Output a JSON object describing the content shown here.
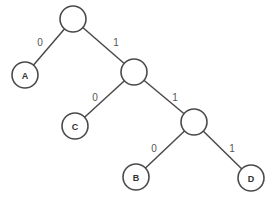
{
  "diagram": {
    "type": "binary-tree",
    "nodes": [
      {
        "id": "n0",
        "label": "",
        "x": 73,
        "y": 19
      },
      {
        "id": "A",
        "label": "A",
        "x": 25,
        "y": 75
      },
      {
        "id": "n1",
        "label": "",
        "x": 134,
        "y": 72
      },
      {
        "id": "C",
        "label": "C",
        "x": 75,
        "y": 126
      },
      {
        "id": "n2",
        "label": "",
        "x": 194,
        "y": 122
      },
      {
        "id": "B",
        "label": "B",
        "x": 136,
        "y": 177
      },
      {
        "id": "D",
        "label": "D",
        "x": 251,
        "y": 178
      }
    ],
    "edges": [
      {
        "from": "n0",
        "to": "A",
        "label": "0",
        "lx": 40,
        "ly": 42
      },
      {
        "from": "n0",
        "to": "n1",
        "label": "1",
        "lx": 116,
        "ly": 42
      },
      {
        "from": "n1",
        "to": "C",
        "label": "0",
        "lx": 95,
        "ly": 97
      },
      {
        "from": "n1",
        "to": "n2",
        "label": "1",
        "lx": 175,
        "ly": 97
      },
      {
        "from": "n2",
        "to": "B",
        "label": "0",
        "lx": 154,
        "ly": 148
      },
      {
        "from": "n2",
        "to": "D",
        "label": "1",
        "lx": 232,
        "ly": 148
      }
    ],
    "node_radius": 13
  }
}
